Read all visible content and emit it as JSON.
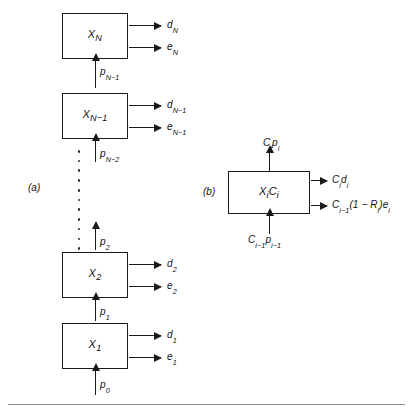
{
  "figure": {
    "background_color": "#ffffff",
    "stroke_color": "#1a1a1a",
    "panel_a_tag": "(a)",
    "panel_b_tag": "(b)"
  },
  "panel_a": {
    "stages": [
      {
        "id": "stage-N",
        "box_label": "X",
        "box_sub": "N",
        "out_top_label": "d",
        "out_top_sub": "N",
        "out_bottom_label": "e",
        "out_bottom_sub": "N",
        "in_label": "p",
        "in_sub": "N−1"
      },
      {
        "id": "stage-N-1",
        "box_label": "X",
        "box_sub": "N−1",
        "out_top_label": "d",
        "out_top_sub": "N−1",
        "out_bottom_label": "e",
        "out_bottom_sub": "N−1",
        "in_label": "p",
        "in_sub": "N−2"
      },
      {
        "id": "stage-2",
        "box_label": "X",
        "box_sub": "2",
        "out_top_label": "d",
        "out_top_sub": "2",
        "out_bottom_label": "e",
        "out_bottom_sub": "2",
        "in_label": "p",
        "in_sub": "1"
      },
      {
        "id": "stage-1",
        "box_label": "X",
        "box_sub": "1",
        "out_top_label": "d",
        "out_top_sub": "1",
        "out_bottom_label": "e",
        "out_bottom_sub": "1",
        "in_label": "p",
        "in_sub": "0"
      }
    ],
    "ellipsis_dot_count": 11,
    "top_p_label": "p",
    "top_p_sub": "N−1",
    "mid_p_label": "p",
    "mid_p_sub": "N−2",
    "lower_p_label": "p",
    "lower_p_sub": "2"
  },
  "panel_b": {
    "box_label": "X",
    "box_sub_1": "i",
    "box_label_2": "C",
    "box_sub_2": "i",
    "box_text": "XiCi",
    "top_arrow_label": "C",
    "top_arrow_sub_1": "i",
    "top_arrow_label_2": "p",
    "top_arrow_sub_2": "i",
    "top_text": "Cipi",
    "right_top_text": "Cidi",
    "right_bottom_text": "Ci−1(1 − Ri)ei",
    "bottom_text": "Ci−1pi−1"
  }
}
